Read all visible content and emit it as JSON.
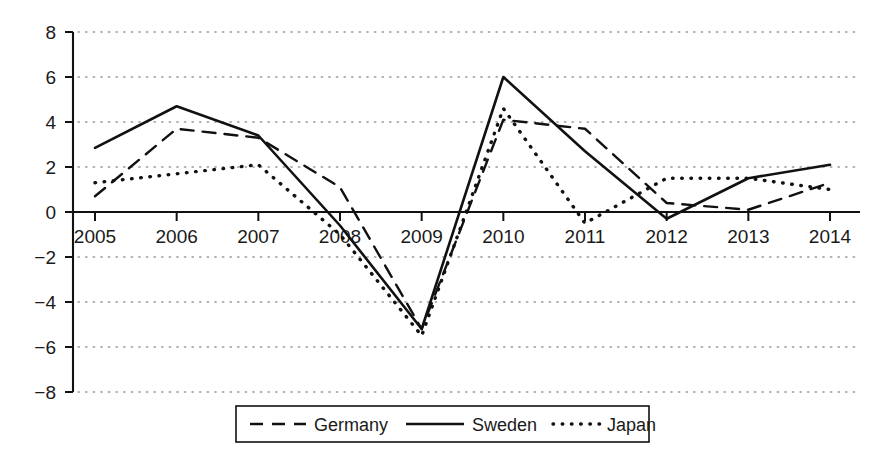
{
  "chart_data": {
    "type": "line",
    "title": "",
    "xlabel": "",
    "ylabel": "",
    "categories": [
      "2005",
      "2006",
      "2007",
      "2008",
      "2009",
      "2010",
      "2011",
      "2012",
      "2013",
      "2014"
    ],
    "x": [
      2005,
      2006,
      2007,
      2008,
      2009,
      2010,
      2011,
      2012,
      2013,
      2014
    ],
    "xlim": [
      2005,
      2014
    ],
    "ylim": [
      -8,
      8
    ],
    "ytick_labels": [
      "8",
      "6",
      "4",
      "2",
      "0",
      "-2",
      "-4",
      "-6",
      "-8"
    ],
    "ytick_values": [
      8,
      6,
      4,
      2,
      0,
      -2,
      -4,
      -6,
      -8
    ],
    "grid": true,
    "grid_style": "dotted-horizontal",
    "legend_position": "bottom-center",
    "series": [
      {
        "name": "Germany",
        "style": "dashed",
        "values": [
          0.7,
          3.7,
          3.3,
          1.1,
          -5.2,
          4.1,
          3.7,
          0.4,
          0.1,
          1.3
        ]
      },
      {
        "name": "Sweden",
        "style": "solid",
        "values": [
          2.85,
          4.7,
          3.4,
          -0.6,
          -5.2,
          6.0,
          2.7,
          -0.3,
          1.5,
          2.1
        ]
      },
      {
        "name": "Japan",
        "style": "dotted",
        "values": [
          1.3,
          1.7,
          2.1,
          -1.0,
          -5.5,
          4.6,
          -0.5,
          1.5,
          1.5,
          1.0
        ]
      }
    ]
  },
  "legend": {
    "entries": [
      {
        "label": "Germany",
        "style": "dashed"
      },
      {
        "label": "Sweden",
        "style": "solid"
      },
      {
        "label": "Japan",
        "style": "dotted"
      }
    ]
  }
}
